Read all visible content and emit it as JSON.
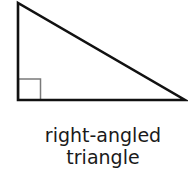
{
  "diagram": {
    "shape": "right-angled triangle",
    "vertices": {
      "top": [
        18,
        3
      ],
      "bottom_left": [
        18,
        100
      ],
      "bottom_right": [
        185,
        100
      ]
    },
    "right_angle_marker": {
      "x": 18,
      "y": 79,
      "size": 22,
      "color": "#808080"
    },
    "stroke_color": "#111111"
  },
  "caption": {
    "line1": "right-angled",
    "line2": "triangle"
  }
}
